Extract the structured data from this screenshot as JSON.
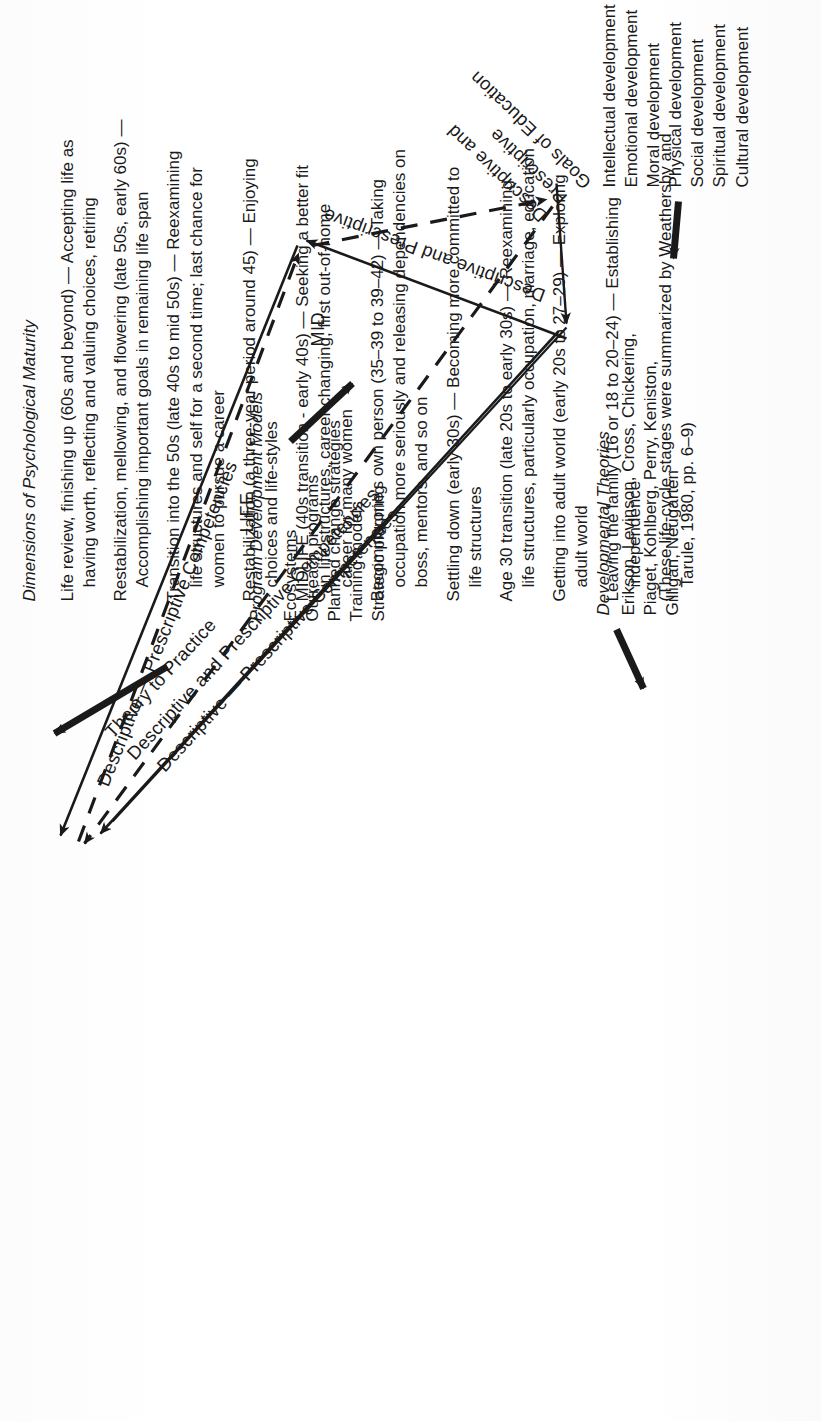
{
  "figure": {
    "orientation": "rotated-90-ccw",
    "ink_color": "#1a1a1a",
    "paper_color": "#ffffff"
  },
  "maturity_panel": {
    "title": "Dimensions of Psychological Maturity",
    "stages": [
      {
        "lines": [
          "Life review, finishing up (60s and beyond) — Accepting life as",
          "having worth, reflecting and valuing choices, retiring"
        ]
      },
      {
        "lines": [
          "Restabilization, mellowing, and flowering (late 50s, early 60s) —",
          "Accomplishing important goals in remaining life span"
        ]
      },
      {
        "lines": [
          "Transition into the 50s (late 40s to mid 50s) — Reexamining",
          "life structures and self for a second time; last chance for",
          "women to pursue a career"
        ]
      },
      {
        "lines": [
          "Restabilization (a three-year period around 45) — Enjoying",
          "choices and life-styles"
        ]
      },
      {
        "lines": [
          "MIDLIFE (40s transition - early 40s) — Seeking a better fit",
          "in life structures, career changing, first out-of-home",
          "career for many women"
        ]
      },
      {
        "lines": [
          "Becoming one's own person (35–39 to 39–42) — Taking",
          "occupation more seriously and releasing dependencies on",
          "boss, mentors, and so on"
        ]
      },
      {
        "lines": [
          "Settling down (early 30s) — Becoming more committed to",
          "life structures"
        ]
      },
      {
        "lines": [
          "Age 30 transition (late 20s to early 30s) — Reexamining",
          "life structures, particularly occupation, marriage, education"
        ]
      },
      {
        "lines": [
          "Getting into adult world (early 20s to 27–29) — Exploring",
          "adult world"
        ]
      },
      {
        "lines": [
          "Leaving the family (16 or 18 to 20–24) — Establishing",
          "independence"
        ]
      },
      {
        "lines": [
          "(These life-cycle stages were summarized by Weathersby and",
          "Tarule, 1980, pp. 6–9)"
        ]
      }
    ]
  },
  "program_panel": {
    "title": "Program Development Models",
    "items": [
      "Ecosystems",
      "Outreach programs",
      "Planned change strategies",
      "Training models",
      "Strategic planning"
    ]
  },
  "theories_panel": {
    "title": "Developmental Theories",
    "lines": [
      "Erikson, Levinson, Cross, Chickering,",
      "Piaget, Kohlberg, Perry, Keniston,",
      "Gilligan, Neugarten"
    ]
  },
  "goals_panel": {
    "items": [
      "Intellectual development",
      "Emotional development",
      "Moral development",
      "Physical development",
      "Social development",
      "Spiritual development",
      "Cultural development"
    ]
  },
  "triangle": {
    "edge_labels": {
      "top_left_edge": "Descriptive — Prescriptive Competencies",
      "bottom_left_edge": "Descriptive — Prescriptive Competencies",
      "inner_upper": "Descriptive and Prescriptive Competencies",
      "inner_upper_second": "Theory to Practice",
      "right_edge": "Descriptive and Prescriptive",
      "inner_lower": "Descriptive and",
      "inner_lower_second": "Prescriptive",
      "goals_edge": "Goals of Education"
    },
    "zones": {
      "upper": "LIFE",
      "lower": "MID"
    }
  }
}
